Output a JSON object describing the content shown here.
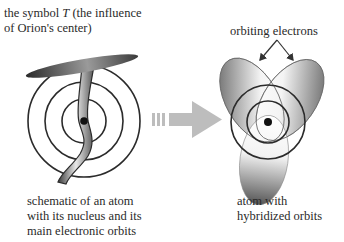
{
  "labels": {
    "symbol_T": [
      "the symbol T (the influence",
      "of Orion's center)"
    ],
    "orbiting_electrons": "orbiting electrons",
    "schematic": [
      "schematic of an atom",
      "with its nucleus and its",
      "main electronic orbits"
    ],
    "hybridized": [
      "atom with",
      "hybridized orbits"
    ]
  },
  "figures": {
    "left": {
      "name": "atom-with-T-symbol",
      "orbit_count": 3
    },
    "arrow": {
      "name": "transformation-arrow",
      "direction": "right"
    },
    "right": {
      "name": "atom-with-hybridized-orbits",
      "circle_count": 2,
      "lobe_count": 3
    }
  },
  "colors": {
    "ink": "#222222",
    "arrow": "#bdbdbd",
    "lobe_dark": "#6a6a6a",
    "lobe_light": "#f2f2f2"
  }
}
